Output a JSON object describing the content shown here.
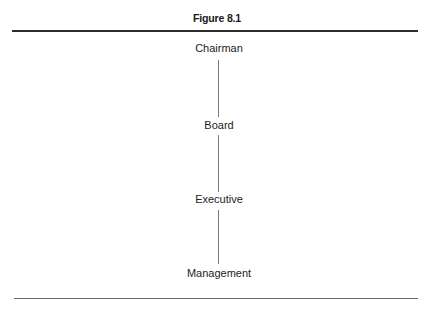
{
  "figure": {
    "title": "Figure 8.1"
  },
  "hierarchy": {
    "nodes": [
      {
        "label": "Chairman"
      },
      {
        "label": "Board"
      },
      {
        "label": "Executive"
      },
      {
        "label": "Management"
      }
    ],
    "edges": [
      {
        "from": "Chairman",
        "to": "Board"
      },
      {
        "from": "Board",
        "to": "Executive"
      },
      {
        "from": "Executive",
        "to": "Management"
      }
    ]
  },
  "colors": {
    "text": "#1c1c1c",
    "top_rule": "#2b2b2b",
    "bottom_rule": "#6a6a6a",
    "connector": "#7a7a7a"
  }
}
